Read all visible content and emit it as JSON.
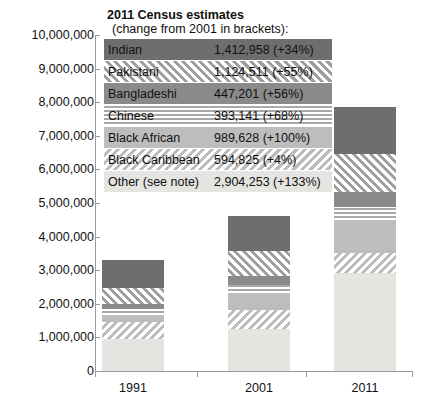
{
  "chart_data": {
    "type": "bar",
    "subtype": "stacked-bar",
    "title": "2011 Census estimates",
    "subtitle": "(change from 2001 in brackets):",
    "xlabel": "",
    "ylabel": "",
    "categories": [
      "1991",
      "2001",
      "2011"
    ],
    "ylim": [
      0,
      10000000
    ],
    "ytick_values": [
      0,
      1000000,
      2000000,
      3000000,
      4000000,
      5000000,
      6000000,
      7000000,
      8000000,
      9000000,
      10000000
    ],
    "ytick_labels": [
      "0",
      "1,000,000",
      "2,000,000",
      "3,000,000",
      "4,000,000",
      "5,000,000",
      "6,000,000",
      "7,000,000",
      "8,000,000",
      "9,000,000",
      "10,000,000"
    ],
    "grid": false,
    "legend_position": "top-inside",
    "stack_order_bottom_to_top": [
      "Other (see note)",
      "Black Caribbean",
      "Black African",
      "Chinese",
      "Bangladeshi",
      "Pakistani",
      "Indian"
    ],
    "series": [
      {
        "name": "Indian",
        "color": "#6e6e6e",
        "pattern": "solid",
        "values": [
          840000,
          1054000,
          1412958
        ]
      },
      {
        "name": "Pakistani",
        "color": "#9e9e9e",
        "pattern": "diagonal-hatch",
        "values": [
          477000,
          725000,
          1124511
        ]
      },
      {
        "name": "Bangladeshi",
        "color": "#8a8a8a",
        "pattern": "solid",
        "values": [
          163000,
          287000,
          447201
        ]
      },
      {
        "name": "Chinese",
        "color": "#a9a9a9",
        "pattern": "horizontal-lines",
        "values": [
          157000,
          234000,
          393141
        ]
      },
      {
        "name": "Black African",
        "color": "#bdbdbd",
        "pattern": "solid",
        "values": [
          212000,
          495000,
          989628
        ]
      },
      {
        "name": "Black Caribbean",
        "color": "#bcbcbc",
        "pattern": "reverse-hatch",
        "values": [
          500000,
          572000,
          594825
        ]
      },
      {
        "name": "Other (see note)",
        "color": "#e4e4e0",
        "pattern": "solid",
        "values": [
          966000,
          1246000,
          2904253
        ]
      }
    ],
    "totals": [
      3315000,
      4613000,
      7866517
    ]
  },
  "legend": {
    "title": "2011 Census estimates",
    "subtitle": "(change from 2001 in brackets):",
    "rows": [
      {
        "name": "Indian",
        "value": "1,412,958 (+34%)"
      },
      {
        "name": "Pakistani",
        "value": "1,124,511 (+55%)"
      },
      {
        "name": "Bangladeshi",
        "value": "447,201 (+56%)"
      },
      {
        "name": "Chinese",
        "value": "393,141 (+68%)"
      },
      {
        "name": "Black African",
        "value": "989,628 (+100%)"
      },
      {
        "name": "Black Caribbean",
        "value": "594,825 (+4%)"
      },
      {
        "name": "Other (see note)",
        "value": "2,904,253 (+133%)"
      }
    ]
  },
  "axes": {
    "y_labels": [
      "10,000,000",
      "9,000,000",
      "8,000,000",
      "7,000,000",
      "6,000,000",
      "5,000,000",
      "4,000,000",
      "3,000,000",
      "2,000,000",
      "1,000,000",
      "0"
    ],
    "x_labels": [
      "1991",
      "2001",
      "2011"
    ]
  }
}
